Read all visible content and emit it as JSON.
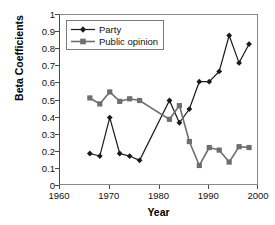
{
  "chart_data": {
    "type": "line",
    "title": "",
    "xlabel": "Year",
    "ylabel": "Beta Coefficients",
    "xlim": [
      1960,
      2000
    ],
    "ylim": [
      0,
      1
    ],
    "grid": false,
    "legend_position": "top-left",
    "xticks": [
      1960,
      1970,
      1980,
      1990,
      2000
    ],
    "xtick_labels": [
      "1960",
      "1970",
      "1980",
      "1990",
      "2000"
    ],
    "yticks": [
      0,
      0.1,
      0.2,
      0.3,
      0.4,
      0.5,
      0.6,
      0.7,
      0.8,
      0.9,
      1
    ],
    "ytick_labels": [
      "0",
      "0.1",
      "0.2",
      "0.3",
      "0.4",
      "0.5",
      "0.6",
      "0.7",
      "0.8",
      "0.9",
      "1"
    ],
    "series": [
      {
        "name": "Party",
        "color": "#1a1a1a",
        "marker": "diamond",
        "x": [
          1966,
          1968,
          1970,
          1972,
          1974,
          1976,
          1982,
          1984,
          1986,
          1988,
          1990,
          1992,
          1994,
          1996,
          1998
        ],
        "values": [
          0.19,
          0.175,
          0.4,
          0.19,
          0.175,
          0.15,
          0.5,
          0.37,
          0.45,
          0.61,
          0.61,
          0.67,
          0.88,
          0.72,
          0.83
        ]
      },
      {
        "name": "Public opinion",
        "color": "#6e6e6e",
        "marker": "square",
        "x": [
          1966,
          1968,
          1970,
          1972,
          1974,
          1976,
          1982,
          1984,
          1986,
          1988,
          1990,
          1992,
          1994,
          1996,
          1998
        ],
        "values": [
          0.515,
          0.48,
          0.55,
          0.495,
          0.51,
          0.5,
          0.39,
          0.47,
          0.26,
          0.12,
          0.225,
          0.21,
          0.14,
          0.23,
          0.225
        ]
      }
    ]
  },
  "legend": {
    "items": [
      {
        "label": "Party"
      },
      {
        "label": "Public opinion"
      }
    ]
  }
}
